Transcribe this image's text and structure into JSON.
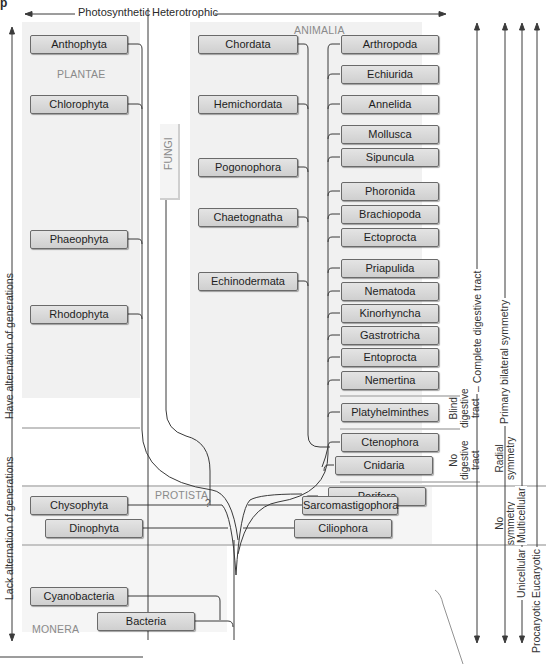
{
  "header": {
    "corner_label": "p",
    "left_label": "Photosynthetic",
    "right_label": "Heterotrophic"
  },
  "kingdoms": {
    "plantae": "PLANTAE",
    "animalia": "ANIMALIA",
    "fungi": "FUNGI",
    "protista": "PROTISTA",
    "monera": "MONERA"
  },
  "plantae_taxa": [
    "Anthophyta",
    "Chlorophyta",
    "Phaeophyta",
    "Rhodophyta"
  ],
  "animalia_left_taxa": [
    "Chordata",
    "Hemichordata",
    "Pogonophora",
    "Chaetognatha",
    "Echinodermata"
  ],
  "animalia_right_taxa": [
    "Arthropoda",
    "Echiurida",
    "Annelida",
    "Mollusca",
    "Sipuncula",
    "Phoronida",
    "Brachiopoda",
    "Ectoprocta",
    "Priapulida",
    "Nematoda",
    "Kinorhyncha",
    "Gastrotricha",
    "Entoprocta",
    "Nemertina",
    "Platyhelminthes",
    "Ctenophora",
    "Cnidaria",
    "Porifera"
  ],
  "protista_taxa": [
    "Chysophyta",
    "Dinophyta",
    "Sarcomastigophora",
    "Ciliophora"
  ],
  "monera_taxa": [
    "Cyanobacteria",
    "Bacteria"
  ],
  "unknown_marker": "?",
  "left_axis": {
    "upper": "Have alternation of generations",
    "lower": "Lack alternation of generations"
  },
  "right_axis": {
    "blind_digestive": [
      "Blind",
      "digestive",
      "tract"
    ],
    "complete_digestive": "– Complete digestive tract",
    "no_digestive": [
      "No",
      "digestive",
      "tract"
    ],
    "radial_symmetry": [
      "Radial",
      "symmetry"
    ],
    "primary_bilateral": "Primary bilateral symmetry",
    "no_symmetry": [
      "No",
      "symmetry"
    ],
    "multicellular": "Multicellular",
    "unicellular": "Unicellular",
    "eucaryotic": "Eucaryotic",
    "procaryotic": "Procaryotic"
  },
  "colors": {
    "panel_bg": "#f1f1f1",
    "box_fill": "#d8d8d8",
    "box_border": "#6a6a6a",
    "separator": "#c4c4c4",
    "line": "#3a3a3a",
    "kingdom_label": "#8a8a8a"
  }
}
